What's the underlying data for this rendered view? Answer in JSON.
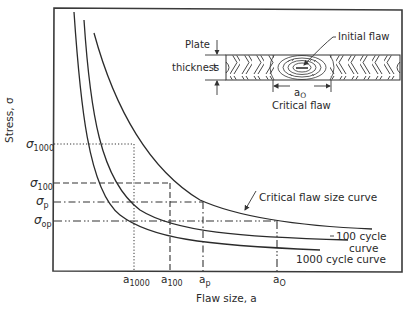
{
  "figure": {
    "axes": {
      "ylabel": "Stress, σ",
      "xlabel": "Flaw size, a"
    },
    "y_ticks": [
      {
        "label": "σ",
        "sub": "1000",
        "y": 144
      },
      {
        "label": "σ",
        "sub": "100",
        "y": 183
      },
      {
        "label": "σ",
        "sub": "p",
        "y": 202
      },
      {
        "label": "σ",
        "sub": "op",
        "y": 221
      }
    ],
    "x_ticks": [
      {
        "label": "a",
        "sub": "1000",
        "x": 134
      },
      {
        "label": "a",
        "sub": "100",
        "x": 170
      },
      {
        "label": "a",
        "sub": "p",
        "x": 203
      },
      {
        "label": "a",
        "sub": "O",
        "x": 277
      }
    ],
    "curves": {
      "critical": "Critical flaw size curve",
      "c100_line1": "100 cycle",
      "c100_line2": "curve",
      "c1000": "1000 cycle curve"
    },
    "inset": {
      "plate_label_line1": "Plate",
      "plate_label_line2": "thickness",
      "thickness_symbol": "t",
      "initial_flaw_label": "Initial flaw",
      "critical_flaw_label": "Critical flaw",
      "dimension_label": "a",
      "dimension_sub": "O"
    }
  }
}
